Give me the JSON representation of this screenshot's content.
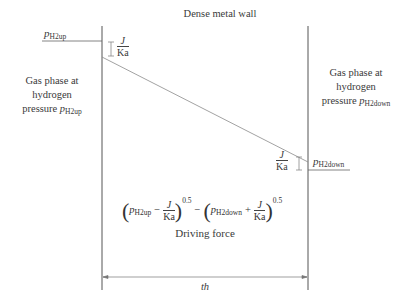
{
  "diagram": {
    "title": "Dense metal wall",
    "left_label": {
      "lines": [
        "Gas phase at",
        "hydrogen",
        "pressure "
      ],
      "symbol": "p",
      "subscript": "H2up"
    },
    "right_label": {
      "lines": [
        "Gas phase at",
        "hydrogen",
        "pressure "
      ],
      "symbol": "p",
      "subscript": "H2down"
    },
    "upstream_pressure": {
      "symbol": "p",
      "subscript": "H2up"
    },
    "downstream_pressure": {
      "symbol": "p",
      "subscript": "H2down"
    },
    "drop_fraction": {
      "numerator": "J",
      "denominator": "Ka"
    },
    "equation": {
      "term1_symbol": "p",
      "term1_subscript": "H2up",
      "minus": "−",
      "plus": "+",
      "term2_symbol": "p",
      "term2_subscript": "H2down",
      "frac_num": "J",
      "frac_den": "Ka",
      "exponent": "0.5",
      "open_paren": "(",
      "close_paren": ")"
    },
    "equation_label": "Driving force",
    "thickness_label": "th",
    "colors": {
      "line": "#555555",
      "slope": "#8a8a8a",
      "text": "#3a3a3a"
    }
  }
}
